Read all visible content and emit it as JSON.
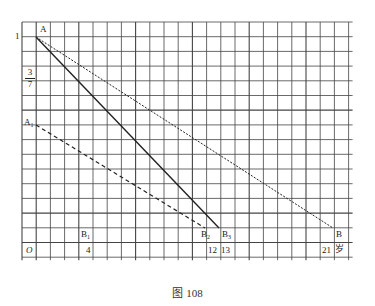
{
  "figure": {
    "caption": "图 108",
    "grid": {
      "cols": 23,
      "rows": 16,
      "x0": 22,
      "y0": 22,
      "cell_w": 14.2,
      "cell_h": 14.7
    },
    "y_labels": {
      "one": "1",
      "frac_num": "3",
      "frac_den": "7"
    },
    "x_labels": {
      "origin": "O",
      "four": "4",
      "twelve": "12",
      "thirteen": "13",
      "twentyone": "21",
      "unit": "岁"
    },
    "points": {
      "A": "A",
      "A1": "A",
      "A1_sub": "1",
      "B": "B",
      "B1": "B",
      "B1_sub": "1",
      "B2": "B",
      "B2_sub": "2",
      "B3": "B",
      "B3_sub": "3"
    },
    "lines": [
      {
        "name": "A-B",
        "style": "dotted",
        "from": [
          36,
          37
        ],
        "to": [
          333,
          228
        ]
      },
      {
        "name": "A-B3",
        "style": "solid",
        "from": [
          36,
          37
        ],
        "to": [
          219,
          228
        ]
      },
      {
        "name": "A1-B2",
        "style": "dashed",
        "from": [
          36,
          125
        ],
        "to": [
          205,
          228
        ]
      }
    ],
    "colors": {
      "grid": "#333333",
      "line": "#222222",
      "background": "#ffffff"
    }
  }
}
